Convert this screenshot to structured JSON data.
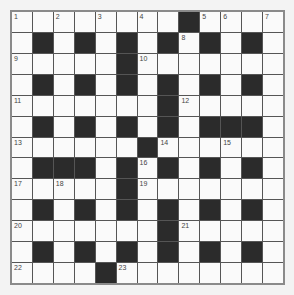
{
  "puzzle": {
    "rows": 13,
    "cols": 13,
    "layout": [
      "........#....",
      ".#.#.#.#.#.#.",
      ".....#.......",
      ".#.#.#.#.#.#.",
      ".......#.....",
      ".#.#.#.#.###.",
      "......#......",
      ".###.#.#.#.#.",
      ".....#.......",
      ".#.#.#.#.#.#.",
      ".......#.....",
      ".#.#.#.#.#.#.",
      "....#........"
    ],
    "numbers": [
      {
        "r": 0,
        "c": 0,
        "n": "1"
      },
      {
        "r": 0,
        "c": 2,
        "n": "2"
      },
      {
        "r": 0,
        "c": 4,
        "n": "3"
      },
      {
        "r": 0,
        "c": 6,
        "n": "4"
      },
      {
        "r": 0,
        "c": 9,
        "n": "5"
      },
      {
        "r": 0,
        "c": 10,
        "n": "6"
      },
      {
        "r": 0,
        "c": 12,
        "n": "7"
      },
      {
        "r": 1,
        "c": 8,
        "n": "8"
      },
      {
        "r": 2,
        "c": 0,
        "n": "9"
      },
      {
        "r": 2,
        "c": 6,
        "n": "10"
      },
      {
        "r": 4,
        "c": 0,
        "n": "11"
      },
      {
        "r": 4,
        "c": 8,
        "n": "12"
      },
      {
        "r": 6,
        "c": 0,
        "n": "13"
      },
      {
        "r": 6,
        "c": 7,
        "n": "14"
      },
      {
        "r": 6,
        "c": 10,
        "n": "15"
      },
      {
        "r": 7,
        "c": 6,
        "n": "16"
      },
      {
        "r": 8,
        "c": 0,
        "n": "17"
      },
      {
        "r": 8,
        "c": 2,
        "n": "18"
      },
      {
        "r": 8,
        "c": 6,
        "n": "19"
      },
      {
        "r": 10,
        "c": 0,
        "n": "20"
      },
      {
        "r": 10,
        "c": 8,
        "n": "21"
      },
      {
        "r": 12,
        "c": 0,
        "n": "22"
      },
      {
        "r": 12,
        "c": 5,
        "n": "23"
      }
    ]
  },
  "colors": {
    "black_cell": "#2b2b2b",
    "white_cell": "#fafafa",
    "border": "#8a8a8a"
  }
}
